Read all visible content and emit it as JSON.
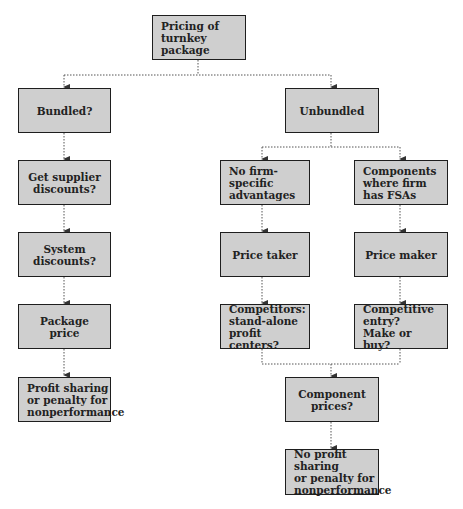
{
  "diagram": {
    "type": "flowchart",
    "nodes": {
      "root": {
        "label": "Pricing of\nturnkey package"
      },
      "bundled": {
        "label": "Bundled?"
      },
      "supplier": {
        "label": "Get supplier\ndiscounts?"
      },
      "system": {
        "label": "System discounts?"
      },
      "package": {
        "label": "Package price"
      },
      "profit": {
        "label": "Profit sharing\nor penalty for\nnonperformance"
      },
      "unbundled": {
        "label": "Unbundled"
      },
      "nofirm": {
        "label": "No firm-\nspecific\nadvantages"
      },
      "components": {
        "label": "Components\nwhere firm\nhas FSAs"
      },
      "taker": {
        "label": "Price taker"
      },
      "maker": {
        "label": "Price maker"
      },
      "competitors": {
        "label": "Competitors:\nstand-alone\nprofit centers?"
      },
      "entry": {
        "label": "Competitive\nentry?\nMake or buy?"
      },
      "compprices": {
        "label": "Component\nprices?"
      },
      "noprofit": {
        "label": "No profit sharing\nor penalty for\nnonperformance"
      }
    },
    "edges": [
      [
        "root",
        "bundled"
      ],
      [
        "root",
        "unbundled"
      ],
      [
        "bundled",
        "supplier"
      ],
      [
        "supplier",
        "system"
      ],
      [
        "system",
        "package"
      ],
      [
        "package",
        "profit"
      ],
      [
        "unbundled",
        "nofirm"
      ],
      [
        "unbundled",
        "components"
      ],
      [
        "nofirm",
        "taker"
      ],
      [
        "components",
        "maker"
      ],
      [
        "taker",
        "competitors"
      ],
      [
        "maker",
        "entry"
      ],
      [
        "competitors",
        "compprices"
      ],
      [
        "entry",
        "compprices"
      ],
      [
        "compprices",
        "noprofit"
      ]
    ],
    "colors": {
      "box_fill": "#cfcfcf",
      "box_border": "#1e1e1e",
      "connector": "#444444"
    }
  }
}
